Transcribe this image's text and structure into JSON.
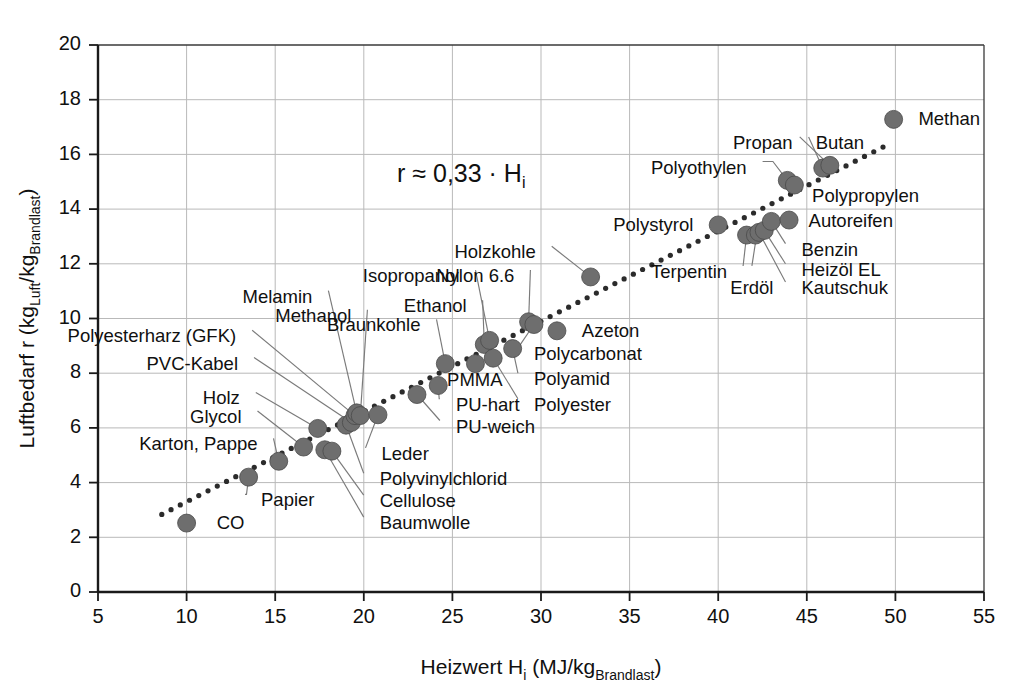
{
  "chart_data": {
    "type": "scatter",
    "title": "",
    "xlabel": "Heizwert Hi (MJ/kgBrandlast)",
    "xlabel_main": "Heizwert H",
    "xlabel_sub1": "i",
    "xlabel_mid": " (MJ/kg",
    "xlabel_sub2": "Brandlast",
    "xlabel_end": ")",
    "ylabel": "Luftbedarf r (kgLuft/kgBrandlast)",
    "ylabel_main": "Luftbedarf r (kg",
    "ylabel_sub1": "Luft",
    "ylabel_mid": "/kg",
    "ylabel_sub2": "Brandlast",
    "ylabel_end": ")",
    "xlim": [
      5,
      55
    ],
    "ylim": [
      0,
      20
    ],
    "xticks": [
      5,
      10,
      15,
      20,
      25,
      30,
      35,
      40,
      45,
      50,
      55
    ],
    "yticks": [
      0,
      2,
      4,
      6,
      8,
      10,
      12,
      14,
      16,
      18,
      20
    ],
    "grid": true,
    "legend": "none",
    "annotation": {
      "text": "r ≈ 0,33 · Hi",
      "lead": "r ",
      "approx": "≈",
      "value": " 0,33 · H",
      "sub": "i",
      "x": 25.5,
      "y": 15.0
    },
    "trendline": {
      "type": "dotted",
      "slope": 0.33,
      "intercept": 0,
      "x_start": 8.6,
      "x_end": 49.3,
      "color": "#2b2b2b"
    },
    "marker": {
      "shape": "circle",
      "color": "#6e6e6e",
      "edge_color": "#4a4a4a",
      "radius_px": 9
    },
    "points": [
      {
        "name": "CO",
        "x": 10.0,
        "y": 2.52,
        "label_x": 11.7,
        "label_y": 2.52,
        "anchor": "start",
        "leader": false
      },
      {
        "name": "Papier",
        "x": 13.5,
        "y": 4.2,
        "label_x": 14.2,
        "label_y": 3.35,
        "anchor": "start",
        "leader": true
      },
      {
        "name": "Karton, Pappe",
        "x": 15.2,
        "y": 4.78,
        "label_x": 14.0,
        "label_y": 5.4,
        "anchor": "end",
        "leader": true
      },
      {
        "name": "Glycol",
        "x": 16.6,
        "y": 5.3,
        "label_x": 13.1,
        "label_y": 6.4,
        "anchor": "end",
        "leader": true
      },
      {
        "name": "Holz",
        "x": 17.4,
        "y": 5.98,
        "label_x": 13.0,
        "label_y": 7.08,
        "anchor": "end",
        "leader": true
      },
      {
        "name": "Baumwolle",
        "x": 17.8,
        "y": 5.2,
        "label_x": 20.9,
        "label_y": 2.52,
        "anchor": "start",
        "leader": true
      },
      {
        "name": "Cellulose",
        "x": 18.2,
        "y": 5.15,
        "label_x": 20.9,
        "label_y": 3.32,
        "anchor": "start",
        "leader": true
      },
      {
        "name": "Polyvinylchlorid",
        "x": 19.0,
        "y": 6.1,
        "label_x": 20.9,
        "label_y": 4.12,
        "anchor": "start",
        "leader": true
      },
      {
        "name": "PVC-Kabel",
        "x": 19.3,
        "y": 6.2,
        "label_x": 12.9,
        "label_y": 8.35,
        "anchor": "end",
        "leader": true
      },
      {
        "name": "Polyesterharz (GFK)",
        "x": 19.5,
        "y": 6.45,
        "label_x": 12.8,
        "label_y": 9.35,
        "anchor": "end",
        "leader": true
      },
      {
        "name": "Melamin",
        "x": 19.6,
        "y": 6.55,
        "label_x": 17.1,
        "label_y": 10.8,
        "anchor": "end",
        "leader": true
      },
      {
        "name": "Methanol",
        "x": 19.8,
        "y": 6.45,
        "label_x": 19.3,
        "label_y": 10.1,
        "anchor": "end",
        "leader": true
      },
      {
        "name": "Leder",
        "x": 20.8,
        "y": 6.48,
        "label_x": 21.0,
        "label_y": 5.05,
        "anchor": "start",
        "leader": true
      },
      {
        "name": "PU-weich",
        "x": 23.0,
        "y": 7.22,
        "label_x": 25.2,
        "label_y": 6.05,
        "anchor": "start",
        "leader": true
      },
      {
        "name": "PU-hart",
        "x": 24.2,
        "y": 7.55,
        "label_x": 25.2,
        "label_y": 6.85,
        "anchor": "start",
        "leader": true
      },
      {
        "name": "Braunkohle",
        "x": 24.6,
        "y": 8.35,
        "label_x": 23.2,
        "label_y": 9.75,
        "anchor": "end",
        "leader": true
      },
      {
        "name": "PMMA",
        "x": 26.3,
        "y": 8.35,
        "label_x": 24.7,
        "label_y": 7.75,
        "anchor": "start",
        "leader": false
      },
      {
        "name": "Ethanol",
        "x": 26.8,
        "y": 9.05,
        "label_x": 25.8,
        "label_y": 10.45,
        "anchor": "end",
        "leader": true
      },
      {
        "name": "Isopropanol",
        "x": 27.1,
        "y": 9.2,
        "label_x": 25.4,
        "label_y": 11.55,
        "anchor": "end",
        "leader": true
      },
      {
        "name": "Polyester",
        "x": 27.3,
        "y": 8.55,
        "label_x": 29.6,
        "label_y": 6.85,
        "anchor": "start",
        "leader": true
      },
      {
        "name": "Polyamid",
        "x": 28.4,
        "y": 8.9,
        "label_x": 29.6,
        "label_y": 7.78,
        "anchor": "start",
        "leader": true
      },
      {
        "name": "Nylon 6.6",
        "x": 29.3,
        "y": 9.88,
        "label_x": 28.5,
        "label_y": 11.55,
        "anchor": "end",
        "leader": true
      },
      {
        "name": "Polycarbonat",
        "x": 29.6,
        "y": 9.78,
        "label_x": 29.6,
        "label_y": 8.7,
        "anchor": "start",
        "leader": true
      },
      {
        "name": "Azeton",
        "x": 30.9,
        "y": 9.55,
        "label_x": 32.3,
        "label_y": 9.55,
        "anchor": "start",
        "leader": false
      },
      {
        "name": "Holzkohle",
        "x": 32.8,
        "y": 11.52,
        "label_x": 29.7,
        "label_y": 12.42,
        "anchor": "end",
        "leader": true
      },
      {
        "name": "Polystyrol",
        "x": 40.0,
        "y": 13.42,
        "label_x": 38.6,
        "label_y": 13.42,
        "anchor": "end",
        "leader": false
      },
      {
        "name": "Terpentin",
        "x": 41.6,
        "y": 13.05,
        "label_x": 40.5,
        "label_y": 11.7,
        "anchor": "end",
        "leader": true
      },
      {
        "name": "Erdöl",
        "x": 42.1,
        "y": 13.05,
        "label_x": 41.9,
        "label_y": 11.12,
        "anchor": "middle",
        "leader": true
      },
      {
        "name": "Kautschuk",
        "x": 42.3,
        "y": 13.15,
        "label_x": 44.7,
        "label_y": 11.12,
        "anchor": "start",
        "leader": true
      },
      {
        "name": "Heizöl EL",
        "x": 42.6,
        "y": 13.22,
        "label_x": 44.7,
        "label_y": 11.78,
        "anchor": "start",
        "leader": true
      },
      {
        "name": "Benzin",
        "x": 43.0,
        "y": 13.55,
        "label_x": 44.7,
        "label_y": 12.52,
        "anchor": "start",
        "leader": true
      },
      {
        "name": "Autoreifen",
        "x": 44.0,
        "y": 13.6,
        "label_x": 45.1,
        "label_y": 13.55,
        "anchor": "start",
        "leader": true
      },
      {
        "name": "Polyothylen",
        "x": 43.9,
        "y": 15.05,
        "label_x": 41.6,
        "label_y": 15.52,
        "anchor": "end",
        "leader": true
      },
      {
        "name": "Polypropylen",
        "x": 44.3,
        "y": 14.88,
        "label_x": 45.3,
        "label_y": 14.48,
        "anchor": "start",
        "leader": true
      },
      {
        "name": "Propan",
        "x": 45.9,
        "y": 15.5,
        "label_x": 44.2,
        "label_y": 16.42,
        "anchor": "end",
        "leader": true
      },
      {
        "name": "Butan",
        "x": 46.3,
        "y": 15.6,
        "label_x": 45.5,
        "label_y": 16.42,
        "anchor": "start",
        "leader": true
      },
      {
        "name": "Methan",
        "x": 49.9,
        "y": 17.28,
        "label_x": 51.3,
        "label_y": 17.28,
        "anchor": "start",
        "leader": false
      }
    ]
  }
}
